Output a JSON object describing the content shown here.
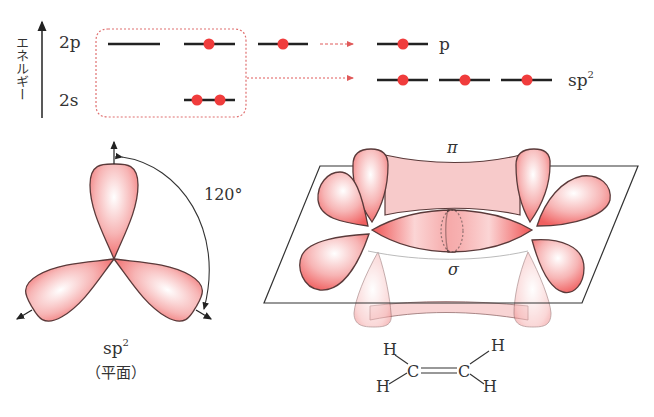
{
  "energy_diagram": {
    "axis_label": "エネルギー",
    "levels": {
      "2p": "2p",
      "2s": "2s"
    },
    "result_labels": {
      "p": "p",
      "sp2_base": "sp",
      "sp2_sup": "2"
    },
    "colors": {
      "electron": "#f03c3c",
      "arrow": "#e05a5a",
      "box": "#e07070",
      "line": "#222222"
    }
  },
  "sp2_orbital": {
    "angle_label": "120°",
    "name_base": "sp",
    "name_sup": "2",
    "geometry_label": "（平面）"
  },
  "ethylene_orbitals": {
    "pi_label": "π",
    "sigma_label": "σ",
    "lobe_color": "#f28a8a"
  },
  "ethylene_structure": {
    "atoms": [
      "H",
      "H",
      "C",
      "C",
      "H",
      "H"
    ],
    "bond": "C=C"
  }
}
